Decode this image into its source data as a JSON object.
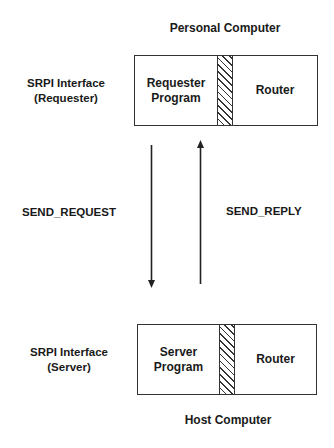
{
  "diagram": {
    "top_system": {
      "title": "Personal Computer",
      "interface_label_line1": "SRPI Interface",
      "interface_label_line2": "(Requester)",
      "program_line1": "Requester",
      "program_line2": "Program",
      "router": "Router"
    },
    "bottom_system": {
      "title": "Host Computer",
      "interface_label_line1": "SRPI Interface",
      "interface_label_line2": "(Server)",
      "program_line1": "Server",
      "program_line2": "Program",
      "router": "Router"
    },
    "messages": {
      "request": "SEND_REQUEST",
      "reply": "SEND_REPLY"
    },
    "arrows": [
      {
        "from": "Requester Program",
        "to": "Server Program",
        "label": "SEND_REQUEST",
        "direction": "down"
      },
      {
        "from": "Server Program",
        "to": "Requester Program",
        "label": "SEND_REPLY",
        "direction": "up"
      }
    ],
    "colors": {
      "background": "#ffffff",
      "line": "#333333",
      "text": "#1a1a1a"
    }
  }
}
